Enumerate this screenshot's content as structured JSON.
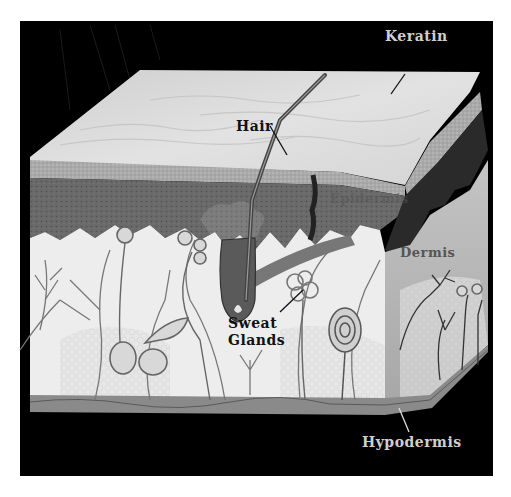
{
  "diagram": {
    "labels": {
      "keratin": "Keratin",
      "hair": "Hair",
      "epidermis": "Epidermis",
      "dermis": "Dermis",
      "sweat_glands_line1": "Sweat",
      "sweat_glands_line2": "Glands",
      "hypodermis": "Hypodermis"
    },
    "colors": {
      "background": "#000000",
      "keratin_surface": "#d9d9d9",
      "epidermis": "#6e6e6e",
      "dermis": "#ececec",
      "side_face": "#bdbdbd",
      "hypodermis_band": "#8a8a8a",
      "label_light": "#cfcfcf",
      "label_dark": "#111111"
    }
  }
}
